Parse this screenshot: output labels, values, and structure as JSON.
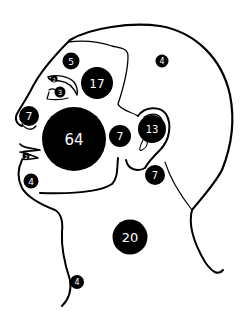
{
  "figure": {
    "type": "head-profile-distribution-map",
    "colors": {
      "marker_fill": "#000000",
      "marker_text": "#ffffff",
      "outline": "#000000",
      "background": "#ffffff"
    },
    "markers": [
      {
        "id": "forehead",
        "label": "5",
        "cx": 71,
        "cy": 61,
        "r": 8.5,
        "font": 9
      },
      {
        "id": "temple",
        "label": "17",
        "cx": 97,
        "cy": 83,
        "r": 16,
        "font": 12
      },
      {
        "id": "scalp",
        "label": "4",
        "cx": 162,
        "cy": 61,
        "r": 6.5,
        "font": 8
      },
      {
        "id": "eyebrow",
        "label": "2",
        "cx": 54,
        "cy": 79,
        "r": 3.5,
        "font": 5
      },
      {
        "id": "eye",
        "label": "3",
        "cx": 60,
        "cy": 92,
        "r": 5.5,
        "font": 7
      },
      {
        "id": "nose",
        "label": "7",
        "cx": 29,
        "cy": 116,
        "r": 10,
        "font": 11
      },
      {
        "id": "cheek",
        "label": "64",
        "cx": 74,
        "cy": 139,
        "r": 32,
        "font": 15
      },
      {
        "id": "pre-auricular",
        "label": "7",
        "cx": 120,
        "cy": 136,
        "r": 11,
        "font": 11
      },
      {
        "id": "ear",
        "label": "13",
        "cx": 152,
        "cy": 129,
        "r": 14,
        "font": 10
      },
      {
        "id": "lip",
        "label": "2",
        "cx": 26,
        "cy": 156,
        "r": 3.5,
        "font": 5
      },
      {
        "id": "chin",
        "label": "4",
        "cx": 31,
        "cy": 181,
        "r": 7.5,
        "font": 9
      },
      {
        "id": "post-auricular",
        "label": "7",
        "cx": 155,
        "cy": 175,
        "r": 10,
        "font": 10
      },
      {
        "id": "neck",
        "label": "20",
        "cx": 130,
        "cy": 237,
        "r": 17.5,
        "font": 13
      },
      {
        "id": "throat",
        "label": "4",
        "cx": 77,
        "cy": 282,
        "r": 7,
        "font": 8
      }
    ]
  }
}
